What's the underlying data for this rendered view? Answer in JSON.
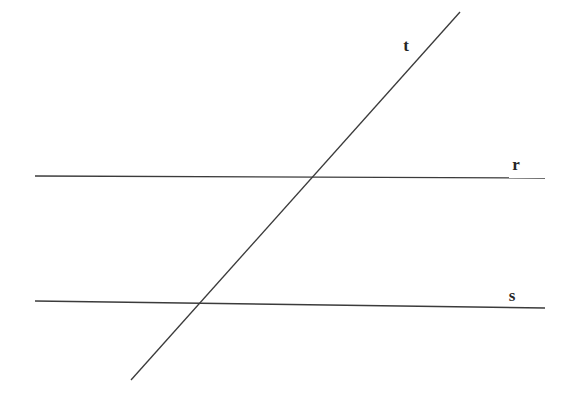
{
  "diagram": {
    "type": "geometry-line-diagram",
    "background_color": "#ffffff",
    "stroke_color": "#3b3b3b",
    "label_color": "#262626",
    "canvas": {
      "width": 569,
      "height": 400
    },
    "lines": [
      {
        "id": "line-r",
        "label": "r",
        "role": "parallel-line-upper",
        "x1": 35,
        "y1": 176,
        "x2": 545,
        "y2": 178,
        "label_x": 516,
        "label_y": 170
      },
      {
        "id": "line-s",
        "label": "s",
        "role": "parallel-line-lower",
        "x1": 35,
        "y1": 301,
        "x2": 545,
        "y2": 308,
        "label_x": 512,
        "label_y": 301
      },
      {
        "id": "line-t",
        "label": "t",
        "role": "transversal",
        "x1": 131,
        "y1": 380,
        "x2": 460,
        "y2": 12,
        "label_x": 406,
        "label_y": 51
      }
    ],
    "intersections": [
      {
        "id": "intersection-t-r",
        "lines": "t and r",
        "x": 310,
        "y": 177
      },
      {
        "id": "intersection-t-s",
        "lines": "t and s",
        "x": 192,
        "y": 306
      }
    ]
  }
}
